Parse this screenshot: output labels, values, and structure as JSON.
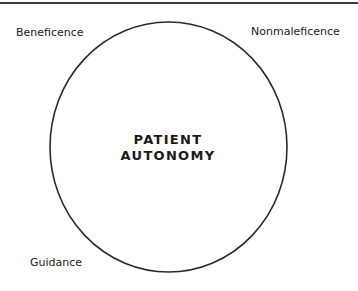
{
  "diagram": {
    "center": {
      "line1": "PATIENT",
      "line2": "AUTONOMY"
    },
    "corners": {
      "top_left": "Beneficence",
      "top_right": "Nonmaleficence",
      "bottom_left": "Guidance"
    },
    "colors": {
      "stroke": "#2a2a2a",
      "text": "#222222",
      "background": "#ffffff"
    }
  }
}
